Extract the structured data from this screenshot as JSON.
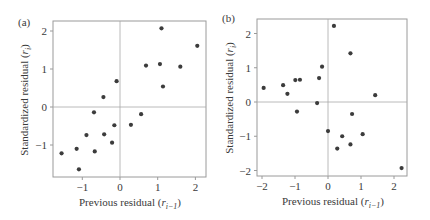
{
  "chart_data": [
    {
      "type": "scatter",
      "panel_label": "(a)",
      "title": "",
      "xlabel": "Previous residual (r_{i-1})",
      "xlabel_main": "Previous residual (",
      "xlabel_var": "r",
      "xlabel_sub": "i−1",
      "xlabel_close": ")",
      "ylabel": "Standardized residual (r_i)",
      "ylabel_main": "Standardized residual (",
      "ylabel_var": "r",
      "ylabel_sub": "i",
      "ylabel_close": ")",
      "xlim": [
        -1.8,
        2.3
      ],
      "ylim": [
        -1.85,
        2.3
      ],
      "xticks": [
        -1,
        0,
        1,
        2
      ],
      "xtick_labels": [
        "−1",
        "0",
        "1",
        "2"
      ],
      "yticks": [
        -1,
        0,
        1,
        2
      ],
      "ytick_labels": [
        "−1",
        "0",
        "1",
        "2"
      ],
      "reference_lines": {
        "x": 0,
        "y": 0
      },
      "grid": false,
      "x": [
        -0.69,
        -0.15,
        -0.89,
        -0.42,
        -0.21,
        -1.55,
        -1.15,
        -0.67,
        -1.09,
        1.1,
        2.05,
        0.69,
        1.06,
        1.6,
        1.14,
        -0.09,
        -0.44,
        0.56,
        0.29
      ],
      "y": [
        -0.14,
        -0.48,
        -0.74,
        -0.72,
        -0.94,
        -1.22,
        -1.1,
        -1.17,
        -1.64,
        2.07,
        1.61,
        1.09,
        1.13,
        1.06,
        0.54,
        0.68,
        0.26,
        -0.19,
        -0.47
      ]
    },
    {
      "type": "scatter",
      "panel_label": "(b)",
      "title": "",
      "xlabel": "Previous residual (r_{i-1})",
      "xlabel_main": "Previous residual (",
      "xlabel_var": "r",
      "xlabel_sub": "i−1",
      "xlabel_close": ")",
      "ylabel": "Standardized residual (r_i)",
      "ylabel_main": "Standardized residual (",
      "ylabel_var": "r",
      "ylabel_sub": "i",
      "ylabel_close": ")",
      "xlim": [
        -2.1,
        2.4
      ],
      "ylim": [
        -2.15,
        2.4
      ],
      "xticks": [
        -2,
        -1,
        0,
        1,
        2
      ],
      "xtick_labels": [
        "−2",
        "−1",
        "0",
        "1",
        "2"
      ],
      "yticks": [
        -2,
        -1,
        0,
        1,
        2
      ],
      "ytick_labels": [
        "−2",
        "−1",
        "0",
        "1",
        "2"
      ],
      "reference_lines": {
        "x": 0,
        "y": 0
      },
      "grid": false,
      "x": [
        0.18,
        -0.18,
        -0.27,
        -0.99,
        -0.85,
        -1.36,
        -1.95,
        -1.23,
        -0.33,
        -0.94,
        0.68,
        1.43,
        0.73,
        0.0,
        0.43,
        1.05,
        0.68,
        0.28,
        2.23
      ],
      "y": [
        2.22,
        1.03,
        0.7,
        0.64,
        0.65,
        0.49,
        0.41,
        0.24,
        -0.03,
        -0.28,
        1.42,
        0.2,
        -0.35,
        -0.85,
        -1.0,
        -0.94,
        -1.24,
        -1.36,
        -1.93
      ]
    }
  ],
  "style": {
    "frame_color": "#9a9a9a",
    "refline_color": "#a8a8a8",
    "point_color": "#3c3c3c",
    "text_color": "#3a3a3a"
  }
}
